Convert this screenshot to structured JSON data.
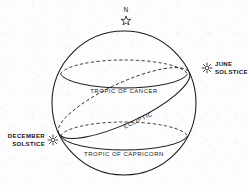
{
  "diagram": {
    "background_color": "#fdfdfd",
    "line_color": "#1a1a1e",
    "sphere": {
      "center_x": 124,
      "center_y": 103,
      "radius": 72
    },
    "labels": {
      "north_pole": "N",
      "june_solstice_line1": "JUNE",
      "june_solstice_line2": "SOLSTICE",
      "december_solstice_line1": "DECEMBER",
      "december_solstice_line2": "SOLSTICE",
      "tropic_of_cancer": "TROPIC OF CANCER",
      "tropic_of_capricorn": "TROPIC OF CAPRICORN",
      "ecliptic": "ECLIPTIC"
    },
    "icons": {
      "north_pole_marker": "star-icon",
      "june_solstice_marker": "sun-star-icon",
      "december_solstice_marker": "sun-star-icon"
    },
    "markers": {
      "north_pole": {
        "x": 126,
        "y": 21
      },
      "june_solstice": {
        "x": 207,
        "y": 68
      },
      "december_solstice": {
        "x": 53,
        "y": 140
      }
    },
    "rings": [
      {
        "name": "tropic-of-cancer",
        "center_y": 74,
        "rx": 64,
        "ry": 16,
        "front_style": "solid",
        "back_style": "dashed"
      },
      {
        "name": "tropic-of-capricorn",
        "center_y": 136,
        "rx": 64,
        "ry": 16,
        "front_style": "solid",
        "back_style": "dashed"
      }
    ],
    "ecliptic": {
      "name": "ecliptic",
      "tilt_degrees": -25,
      "rx": 72,
      "ry": 20,
      "front_style": "solid",
      "back_style": "dashed",
      "from": "december-solstice",
      "to": "june-solstice"
    }
  }
}
